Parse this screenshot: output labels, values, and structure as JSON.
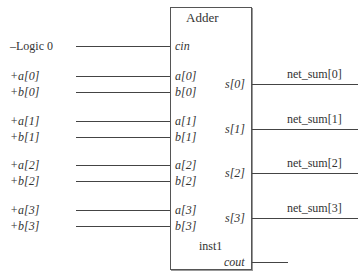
{
  "block": {
    "title": "Adder",
    "instance": "inst1"
  },
  "inputs": [
    {
      "signal": "–Logic 0",
      "port": "cin",
      "italic_signal": false,
      "y": 46
    },
    {
      "signal": "+a[0]",
      "port": "a[0]",
      "italic_signal": true,
      "y": 76
    },
    {
      "signal": "+b[0]",
      "port": "b[0]",
      "italic_signal": true,
      "y": 92
    },
    {
      "signal": "+a[1]",
      "port": "a[1]",
      "italic_signal": true,
      "y": 121
    },
    {
      "signal": "+b[1]",
      "port": "b[1]",
      "italic_signal": true,
      "y": 137
    },
    {
      "signal": "+a[2]",
      "port": "a[2]",
      "italic_signal": true,
      "y": 165
    },
    {
      "signal": "+b[2]",
      "port": "b[2]",
      "italic_signal": true,
      "y": 181
    },
    {
      "signal": "+a[3]",
      "port": "a[3]",
      "italic_signal": true,
      "y": 210
    },
    {
      "signal": "+b[3]",
      "port": "b[3]",
      "italic_signal": true,
      "y": 226
    }
  ],
  "outputs": [
    {
      "port": "s[0]",
      "net": "net_sum[0]",
      "y": 84
    },
    {
      "port": "s[1]",
      "net": "net_sum[1]",
      "y": 129
    },
    {
      "port": "s[2]",
      "net": "net_sum[2]",
      "y": 173
    },
    {
      "port": "s[3]",
      "net": "net_sum[3]",
      "y": 218
    },
    {
      "port": "cout",
      "net": "",
      "y": 262
    }
  ]
}
